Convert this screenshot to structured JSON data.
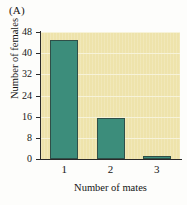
{
  "figure": {
    "panel_label": "(A)"
  },
  "chart_data": {
    "type": "bar",
    "title": "",
    "panel": "(A)",
    "categories": [
      "1",
      "2",
      "3"
    ],
    "values": [
      45,
      15.5,
      1
    ],
    "series": [
      {
        "name": "Number of females",
        "values": [
          45,
          15.5,
          1
        ]
      }
    ],
    "xlabel": "Number of mates",
    "ylabel": "Number of females",
    "ylim": [
      0,
      48
    ],
    "yticks": [
      0,
      8,
      16,
      24,
      32,
      40,
      48
    ],
    "ytick_labels": [
      "0",
      "8",
      "16",
      "24",
      "32",
      "40",
      "48"
    ],
    "xtick_labels": [
      "1",
      "2",
      "3"
    ],
    "grid": true,
    "legend": false,
    "colors": {
      "bar_fill": "#3c8d7b",
      "bar_edge": "#2f4f48",
      "plot_background": "#eee3ab",
      "gridline": "#f7f3da",
      "axis": "#2a2a2a",
      "text": "#151515",
      "page_background": "#fdfdfb"
    }
  }
}
